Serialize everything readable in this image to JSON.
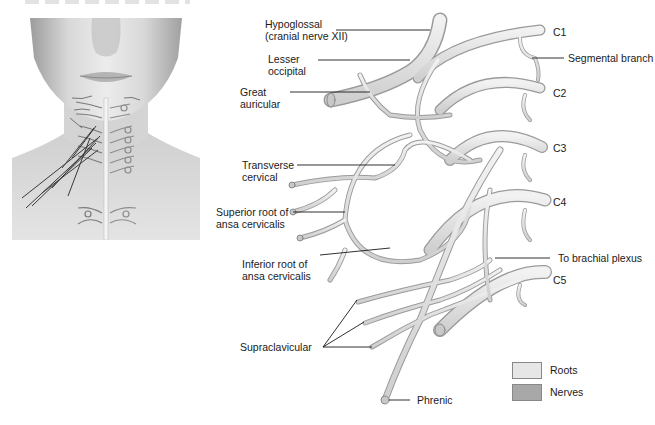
{
  "figure": {
    "type": "anatomical-diagram"
  },
  "labels": {
    "hypoglossal": [
      "Hypoglossal",
      "(cranial nerve XII)"
    ],
    "lesser_occipital": [
      "Lesser",
      "occipital"
    ],
    "great_auricular": [
      "Great",
      "auricular"
    ],
    "transverse_cervical": [
      "Transverse",
      "cervical"
    ],
    "superior_root": [
      "Superior root of",
      "ansa cervicalis"
    ],
    "inferior_root": [
      "Inferior root of",
      "ansa cervicalis"
    ],
    "supraclavicular": "Supraclavicular",
    "phrenic": "Phrenic",
    "c1": "C1",
    "segmental_branch": "Segmental branch",
    "c2": "C2",
    "c3": "C3",
    "c4": "C4",
    "to_brachial_plexus": "To brachial plexus",
    "c5": "C5"
  },
  "legend": {
    "items": [
      {
        "label": "Roots",
        "color": "#e6e6e6"
      },
      {
        "label": "Nerves",
        "color": "#a8a8a8"
      }
    ]
  },
  "colors": {
    "nerve_fill": "#dcdcdc",
    "nerve_stroke": "#9a9a9a",
    "leader_line": "#1a1a1a"
  }
}
